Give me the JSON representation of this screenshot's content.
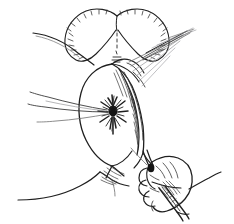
{
  "figure": {
    "kind": "medical-line-drawing",
    "caption": "",
    "background_color": "#ffffff",
    "ink_color": "#1f1f1f",
    "mid_ink_color": "#3a3a3a",
    "light_ink_color": "#6e6e6e",
    "faint_ink_color": "#96969a",
    "knot_color": "#141414",
    "width": 234,
    "height": 224,
    "has_text_labels": false
  },
  "parts": {
    "upper_structure": "heart-shaped-anatomical-body-with-stippled-inner-margin",
    "left_fold": "curved-skin-fold-line-upper-left",
    "right_fold": "curved-skin-fold-line-lower-right",
    "central_oval": "large-oval-tissue-opening-outline",
    "suture_knot": "dark-radiating-suture-knot-center",
    "suture_threads_left": "two-long-thin-threads-extending-left",
    "suture_threads_upper_right": "bundle-of-thin-threads-extending-upper-right",
    "tissue_flap": "hatched-shaded-tissue-flap-retracted-right",
    "perineal_junction": "hatched-tissue-junction-lower-center",
    "hand": "gloved-hand-gripping-instrument-lower-right",
    "instrument": "needle-holder-forceps-held-in-hand"
  }
}
